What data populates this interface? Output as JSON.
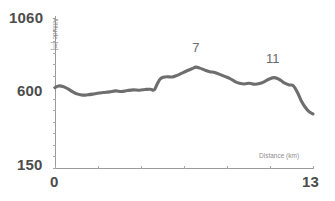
{
  "chart_data": {
    "type": "line",
    "title": "",
    "subtitle": "",
    "xlabel": "Distance (km)",
    "ylabel": "Altitude [m]",
    "xlim": [
      0,
      13
    ],
    "ylim": [
      150,
      1060
    ],
    "grid": false,
    "legend": null,
    "y_ticks_labeled": [
      "1060",
      "600",
      "150"
    ],
    "x_ticks_labeled": [
      "0",
      "13"
    ],
    "line_color": "#6e6e6e",
    "axis_color": "#9a9a9a",
    "series": [
      {
        "name": "Elevation profile",
        "x": [
          0.0,
          0.18,
          0.4,
          0.65,
          0.9,
          1.15,
          1.4,
          1.65,
          1.9,
          2.15,
          2.45,
          2.75,
          3.05,
          3.35,
          3.65,
          3.95,
          4.25,
          4.55,
          4.8,
          5.0,
          5.15,
          5.3,
          5.45,
          5.65,
          5.9,
          6.15,
          6.4,
          6.65,
          6.9,
          7.1,
          7.3,
          7.55,
          7.8,
          8.05,
          8.3,
          8.55,
          8.8,
          9.05,
          9.3,
          9.55,
          9.8,
          10.05,
          10.3,
          10.55,
          10.8,
          11.05,
          11.3,
          11.55,
          11.8,
          12.0,
          12.2,
          12.4,
          12.6,
          12.8,
          13.0
        ],
        "y": [
          638,
          648,
          645,
          630,
          612,
          598,
          592,
          594,
          598,
          604,
          608,
          612,
          618,
          614,
          620,
          624,
          622,
          626,
          628,
          624,
          660,
          690,
          700,
          704,
          702,
          712,
          726,
          740,
          752,
          762,
          756,
          744,
          734,
          730,
          718,
          706,
          694,
          676,
          664,
          660,
          664,
          658,
          662,
          674,
          690,
          698,
          688,
          666,
          654,
          650,
          612,
          560,
          520,
          492,
          478
        ]
      }
    ],
    "annotations": [
      {
        "label": "7",
        "x": 7.1,
        "y": 762,
        "dx": 0,
        "dy": -18
      },
      {
        "label": "11",
        "x": 11.0,
        "y": 698,
        "dx": 0,
        "dy": -18
      }
    ]
  },
  "axis_titles": {
    "x": "Distance (km)",
    "y": "Altitude [m]"
  },
  "tick_labels": {
    "y_max": "1060",
    "y_mid": "600",
    "y_min": "150",
    "x_min": "0",
    "x_max": "13"
  },
  "peak_labels": {
    "peak_a": "7",
    "peak_b": "11"
  }
}
